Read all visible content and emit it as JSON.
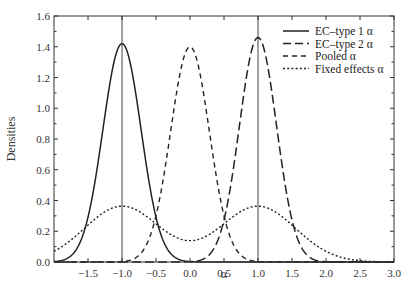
{
  "chart_data": {
    "type": "line",
    "title": "",
    "xlabel": "α",
    "ylabel": "Densities",
    "xlim": [
      -2.0,
      3.0
    ],
    "ylim": [
      0.0,
      1.6
    ],
    "xticks": [
      "-1.5",
      "-1.0",
      "-0.5",
      "0.0",
      "0.5",
      "1.0",
      "1.5",
      "2.0",
      "2.5",
      "3.0"
    ],
    "yticks": [
      "0.0",
      "0.2",
      "0.4",
      "0.6",
      "0.8",
      "1.0",
      "1.2",
      "1.4",
      "1.6"
    ],
    "vertical_lines": [
      -1.0,
      1.0
    ],
    "grid": false,
    "legend_position": "upper right",
    "series": [
      {
        "name": "EC–type 1 α",
        "style": "solid",
        "distribution": "normal",
        "mean": -1.0,
        "peak": 1.42
      },
      {
        "name": "EC–type 2 α",
        "style": "long-dash",
        "distribution": "normal",
        "mean": 1.0,
        "peak": 1.46
      },
      {
        "name": "Pooled α",
        "style": "dash",
        "distribution": "normal",
        "mean": 0.0,
        "peak": 1.4
      },
      {
        "name": "Fixed effects α",
        "style": "dotted",
        "distribution": "bimodal mixture",
        "modes": [
          -1.0,
          1.0
        ],
        "peak": 0.36,
        "value_at_0": 0.11
      }
    ]
  },
  "labels": {
    "ylabel": "Densities",
    "xlabel": "α",
    "legend": [
      "EC–type 1 α",
      "EC–type 2 α",
      "Pooled α",
      "Fixed effects α"
    ]
  }
}
